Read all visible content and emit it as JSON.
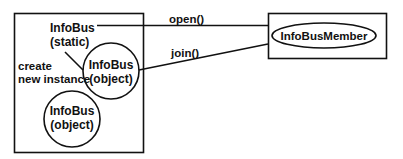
{
  "diagram": {
    "colors": {
      "line": "#111111",
      "background": "#ffffff"
    },
    "left_box": {
      "static_label_line1": "InfoBus",
      "static_label_line2": "(static)",
      "create_label_line1": "create",
      "create_label_line2": "new instance",
      "object1_line1": "InfoBus",
      "object1_line2": "(object)",
      "object2_line1": "InfoBus",
      "object2_line2": "(object)"
    },
    "right_box": {
      "member_label": "InfoBusMember"
    },
    "edges": {
      "open_label": "open()",
      "join_label": "join()"
    }
  }
}
